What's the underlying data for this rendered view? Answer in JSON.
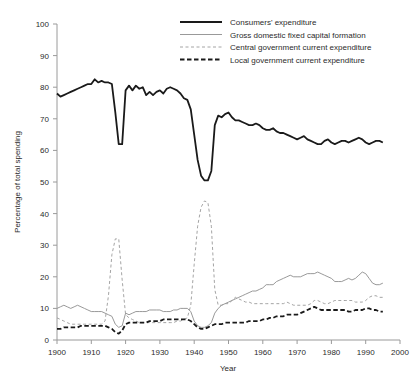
{
  "chart_data": {
    "type": "line",
    "title": "",
    "xlabel": "Year",
    "ylabel": "Percentage of total spending",
    "xlim": [
      1900,
      2000
    ],
    "ylim": [
      0,
      100
    ],
    "xticks": [
      1900,
      1910,
      1920,
      1930,
      1940,
      1950,
      1960,
      1970,
      1980,
      1990,
      2000
    ],
    "yticks": [
      0,
      10,
      20,
      30,
      40,
      50,
      60,
      70,
      80,
      90,
      100
    ],
    "grid": false,
    "legend_position": "top-right",
    "x": [
      1900,
      1901,
      1902,
      1903,
      1904,
      1905,
      1906,
      1907,
      1908,
      1909,
      1910,
      1911,
      1912,
      1913,
      1914,
      1915,
      1916,
      1917,
      1918,
      1919,
      1920,
      1921,
      1922,
      1923,
      1924,
      1925,
      1926,
      1927,
      1928,
      1929,
      1930,
      1931,
      1932,
      1933,
      1934,
      1935,
      1936,
      1937,
      1938,
      1939,
      1940,
      1941,
      1942,
      1943,
      1944,
      1945,
      1946,
      1947,
      1948,
      1949,
      1950,
      1951,
      1952,
      1953,
      1954,
      1955,
      1956,
      1957,
      1958,
      1959,
      1960,
      1961,
      1962,
      1963,
      1964,
      1965,
      1966,
      1967,
      1968,
      1969,
      1970,
      1971,
      1972,
      1973,
      1974,
      1975,
      1976,
      1977,
      1978,
      1979,
      1980,
      1981,
      1982,
      1983,
      1984,
      1985,
      1986,
      1987,
      1988,
      1989,
      1990,
      1991,
      1992,
      1993,
      1994,
      1995
    ],
    "series": [
      {
        "name": "Consumers' expenditure",
        "style": "thick-solid",
        "color": "#1a1a1a",
        "values": [
          78,
          77,
          77.5,
          78,
          78.5,
          79,
          79.5,
          80,
          80.5,
          81,
          81,
          82.5,
          81.5,
          82,
          81.5,
          81.5,
          81,
          72,
          62,
          62,
          79,
          80.5,
          79,
          80.5,
          79.5,
          80,
          77.5,
          78.5,
          77.5,
          78.5,
          79,
          78,
          79.5,
          80,
          79.5,
          79,
          78,
          76.5,
          76,
          73,
          65,
          57,
          52,
          50.5,
          50.5,
          53.5,
          68,
          71,
          70.5,
          71.5,
          72,
          70.5,
          69.5,
          69.5,
          69,
          68.5,
          68,
          68,
          68.5,
          68,
          67,
          66.5,
          66.5,
          67,
          66,
          65.5,
          65.5,
          65,
          64.5,
          64,
          63.5,
          64,
          64.5,
          63.5,
          63,
          62.5,
          62,
          62,
          63,
          63.5,
          62.5,
          62,
          62.5,
          63,
          63,
          62.5,
          63,
          63.5,
          64,
          63.5,
          62.5,
          62,
          62.5,
          63,
          63,
          62.5
        ]
      },
      {
        "name": "Gross domestic fixed capital formation",
        "style": "thin-solid",
        "color": "#8d8d8d",
        "values": [
          10,
          10.5,
          11,
          10.5,
          10,
          10.5,
          11,
          10.5,
          10,
          9.5,
          9,
          9,
          9,
          9,
          8.5,
          8,
          7.5,
          5,
          4,
          4.5,
          8.5,
          8,
          8.5,
          9,
          9,
          9,
          9,
          9.5,
          9.5,
          9.5,
          9.5,
          9,
          9,
          9,
          9.5,
          9.5,
          10,
          10,
          10,
          9,
          6,
          4.5,
          4,
          4,
          4.5,
          5.5,
          8.5,
          10,
          11,
          11.5,
          12,
          12.5,
          13,
          13.5,
          14,
          14.5,
          15,
          15.5,
          15.5,
          16,
          16.5,
          17.5,
          17.5,
          17.5,
          18.5,
          19,
          19.5,
          20,
          20.5,
          20,
          20,
          20,
          20.5,
          21,
          21,
          21,
          21.5,
          21,
          20.5,
          20,
          19.5,
          18.5,
          18.5,
          18.5,
          19,
          19.5,
          19,
          19.5,
          20.5,
          21.5,
          21,
          19.5,
          18,
          17.5,
          17.5,
          18
        ]
      },
      {
        "name": "Central government current expenditure",
        "style": "thin-dashed",
        "color": "#9a9a9a",
        "values": [
          7,
          6.5,
          6,
          5.5,
          5,
          5,
          5,
          5,
          5,
          5,
          5,
          5,
          5,
          5,
          6,
          14,
          27,
          32,
          32,
          19,
          8,
          7,
          6.5,
          6,
          5.5,
          5.5,
          5.5,
          5.5,
          5.5,
          5.5,
          5.5,
          5.5,
          5.5,
          5.5,
          5.5,
          6,
          6,
          6.5,
          7,
          11,
          24,
          36,
          42,
          44,
          43.5,
          36,
          16,
          11,
          11,
          11.5,
          11.5,
          12.5,
          13.5,
          13,
          12.5,
          12,
          12,
          11.5,
          11.5,
          11.5,
          11.5,
          11.5,
          11.5,
          11.5,
          11.5,
          11.5,
          11.5,
          12,
          11.5,
          11,
          11,
          11,
          11,
          11,
          11.5,
          12.5,
          12.5,
          12,
          11.5,
          11.5,
          12,
          12.5,
          12.5,
          12.5,
          12.5,
          12.5,
          12.5,
          12,
          12,
          12,
          12.5,
          13.5,
          14,
          14,
          13.5,
          13.5
        ]
      },
      {
        "name": "Local government current expenditure",
        "style": "thick-dashed",
        "color": "#1a1a1a",
        "values": [
          3.5,
          3.5,
          4,
          4,
          4,
          4,
          4,
          4.5,
          4.5,
          4.5,
          4.5,
          4.5,
          4.5,
          4.5,
          4.5,
          4,
          3.5,
          2.5,
          2,
          3,
          5,
          5.5,
          5.5,
          5.5,
          5.5,
          5.5,
          5.5,
          6,
          6,
          6,
          6,
          6.5,
          6.5,
          6.5,
          6.5,
          6.5,
          6.5,
          6.5,
          6.5,
          6,
          5,
          4,
          3.5,
          3.5,
          4,
          4.5,
          5,
          5,
          5,
          5.5,
          5.5,
          5.5,
          5.5,
          5.5,
          5.5,
          5.5,
          6,
          6,
          6,
          6,
          6.5,
          6.5,
          7,
          7,
          7.5,
          7.5,
          7.5,
          8,
          8,
          8,
          8,
          8.5,
          9,
          9.5,
          10,
          10.5,
          10,
          9.5,
          9.5,
          9.5,
          9.5,
          9.5,
          9.5,
          9.5,
          9.5,
          9,
          9,
          9.5,
          9.5,
          9.5,
          10,
          10,
          9.5,
          9.5,
          9,
          9
        ]
      }
    ]
  },
  "legend": {
    "items": [
      {
        "label": "Consumers' expenditure"
      },
      {
        "label": "Gross domestic fixed capital formation"
      },
      {
        "label": "Central government current expenditure"
      },
      {
        "label": "Local government current expenditure"
      }
    ]
  },
  "axes": {
    "y_title": "Percentage of total spending",
    "x_title": "Year",
    "y_tick_labels": [
      "100",
      "90",
      "80",
      "70",
      "60",
      "50",
      "40",
      "30",
      "20",
      "10",
      "0"
    ],
    "x_tick_labels": [
      "1900",
      "1910",
      "1920",
      "1930",
      "1940",
      "1950",
      "1960",
      "1970",
      "1980",
      "1990",
      "2000"
    ]
  }
}
